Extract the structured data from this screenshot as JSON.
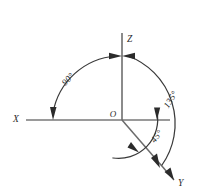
{
  "diagram": {
    "background_color": "#ffffff",
    "axis_color": "#9a9a9a",
    "arc_color": "#3a3a3a",
    "text_color": "#2b2b2b",
    "origin": {
      "label": "O",
      "x": 122,
      "y": 120
    },
    "axes": [
      {
        "name": "x-axis",
        "label": "X",
        "label_x": 16,
        "label_y": 122,
        "direction": "left-horizontal"
      },
      {
        "name": "z-axis",
        "label": "Z",
        "label_x": 127,
        "label_y": 42,
        "direction": "up-vertical"
      },
      {
        "name": "y-axis",
        "label": "Y",
        "label_x": 178,
        "label_y": 186,
        "direction": "lower-right-diagonal"
      }
    ],
    "angles": [
      {
        "name": "angle-x-to-z",
        "label": "90°",
        "value": 90,
        "unit": "degrees",
        "from_axis": "X",
        "to_axis": "Z",
        "label_x": 70,
        "label_y": 81,
        "label_rotation": -47
      },
      {
        "name": "angle-z-to-y",
        "label": "135°",
        "value": 135,
        "unit": "degrees",
        "from_axis": "Z",
        "to_axis": "Y",
        "label_x": 173,
        "label_y": 101,
        "label_rotation": -58
      },
      {
        "name": "angle-x-to-y",
        "label": "45°",
        "value": 45,
        "unit": "degrees",
        "from_axis": "X",
        "to_axis": "Y",
        "label_x": 159,
        "label_y": 138,
        "label_rotation": -52
      }
    ]
  }
}
